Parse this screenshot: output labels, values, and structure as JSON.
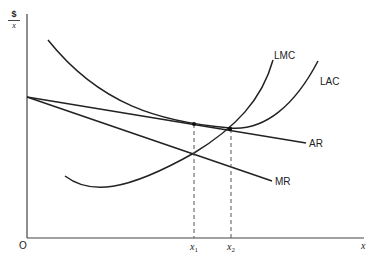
{
  "diagram": {
    "type": "economics-cost-revenue-curves",
    "y_axis_label": {
      "numerator": "$",
      "denominator": "x"
    },
    "x_axis_label": "x",
    "origin_label": "O",
    "curves": [
      {
        "id": "LMC",
        "label": "LMC"
      },
      {
        "id": "LAC",
        "label": "LAC"
      },
      {
        "id": "AR",
        "label": "AR"
      },
      {
        "id": "MR",
        "label": "MR"
      }
    ],
    "x_markers": [
      {
        "label": "x",
        "subscript": "1"
      },
      {
        "label": "x",
        "subscript": "2"
      }
    ],
    "colors": {
      "line": "#222222",
      "dashed": "#555555",
      "background": "#ffffff"
    }
  }
}
